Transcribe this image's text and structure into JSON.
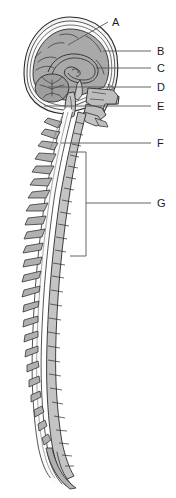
{
  "figure": {
    "background_color": "#ffffff",
    "outline_color": "#2b2b2b",
    "leader_color": "#555555",
    "fills": {
      "brain_gray": "#a9a9a9",
      "skull_white": "#f2f2f2",
      "bone_gray": "#bdbdbd",
      "vertebra_gray": "#c4c4c4",
      "process_gray": "#b0b0b0",
      "cord_white": "#fbfbfb",
      "cerebellum_gray": "#9e9e9e",
      "dark_line": "#3a3a3a"
    }
  },
  "labels": [
    {
      "id": "A",
      "text": "A",
      "x": 112,
      "y": 26,
      "target_x": 68,
      "target_y": 45
    },
    {
      "id": "B",
      "text": "B",
      "x": 157,
      "y": 55,
      "target_x": 103,
      "target_y": 51
    },
    {
      "id": "C",
      "text": "C",
      "x": 157,
      "y": 72,
      "target_x": 96,
      "target_y": 68
    },
    {
      "id": "D",
      "text": "D",
      "x": 157,
      "y": 91,
      "target_x": 48,
      "target_y": 87
    },
    {
      "id": "E",
      "text": "E",
      "x": 157,
      "y": 110,
      "target_x": 44,
      "target_y": 106
    },
    {
      "id": "F",
      "text": "F",
      "x": 157,
      "y": 147,
      "target_x": 61,
      "target_y": 143
    },
    {
      "id": "G",
      "text": "G",
      "x": 157,
      "y": 207,
      "target_x": 86,
      "target_y": 203
    }
  ],
  "leader_lines": [
    {
      "for": "A",
      "x1": 68,
      "y1": 45,
      "x2": 108,
      "y2": 22
    },
    {
      "for": "B",
      "x1": 103,
      "y1": 51,
      "x2": 151,
      "y2": 51
    },
    {
      "for": "C",
      "x1": 96,
      "y1": 68,
      "x2": 151,
      "y2": 68
    },
    {
      "for": "D",
      "x1": 48,
      "y1": 87,
      "x2": 151,
      "y2": 87
    },
    {
      "for": "E",
      "x1": 44,
      "y1": 106,
      "x2": 151,
      "y2": 106
    },
    {
      "for": "F",
      "x1": 61,
      "y1": 143,
      "x2": 151,
      "y2": 143
    },
    {
      "for": "G",
      "x1": 86,
      "y1": 203,
      "x2": 151,
      "y2": 203
    }
  ],
  "bracket": {
    "for": "G",
    "x": 86,
    "y_top": 152,
    "y_bottom": 256,
    "tick_length": 16
  },
  "structures": [
    {
      "name": "skull-outline"
    },
    {
      "name": "cerebrum"
    },
    {
      "name": "corpus-callosum"
    },
    {
      "name": "cerebellum"
    },
    {
      "name": "brainstem"
    },
    {
      "name": "facial-bones"
    },
    {
      "name": "cervical-vertebrae"
    },
    {
      "name": "thoracic-vertebrae"
    },
    {
      "name": "lumbar-vertebrae"
    },
    {
      "name": "sacrum-coccyx"
    },
    {
      "name": "spinal-cord"
    },
    {
      "name": "cauda-equina"
    }
  ]
}
